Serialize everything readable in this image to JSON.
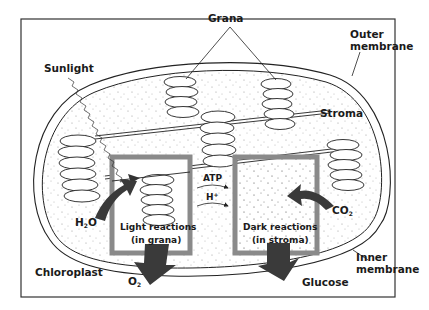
{
  "diagram": {
    "title": "Chloroplast",
    "labels": {
      "grana": "Grana",
      "outer_membrane_1": "Outer",
      "outer_membrane_2": "membrane",
      "sunlight": "Sunlight",
      "stroma": "Stroma",
      "atp": "ATP",
      "h_plus": "H+",
      "h2o": "H2O",
      "co2": "CO2",
      "light_reactions_1": "Light reactions",
      "light_reactions_2": "(in grana)",
      "dark_reactions_1": "Dark reactions",
      "dark_reactions_2": "(in stroma)",
      "chloroplast": "Chloroplast",
      "o2": "O2",
      "glucose": "Glucose",
      "inner_membrane_1": "Inner",
      "inner_membrane_2": "membrane"
    },
    "colors": {
      "frame": "#333333",
      "reaction_box": "#8a8a8a",
      "arrow": "#3a3a3a",
      "stroma_dots": "#9a9a9a",
      "line": "#222222"
    }
  }
}
